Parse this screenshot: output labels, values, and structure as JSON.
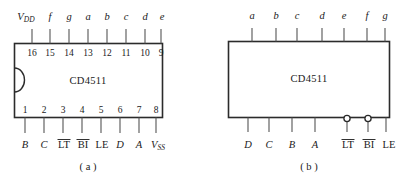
{
  "figure": {
    "ink_color": "#1a1a1a",
    "line_color": "#2b2b2b",
    "lead_color": "#555555",
    "background": "#ffffff"
  },
  "diagram_a": {
    "caption": "( a )",
    "chip_name": "CD4511",
    "package_note": "dual-in-line package outline with left-edge notch",
    "top_pins": [
      {
        "number": "16",
        "label": "V",
        "sub": "DD",
        "italic": true,
        "overbar": false
      },
      {
        "number": "15",
        "label": "f",
        "sub": "",
        "italic": true,
        "overbar": false
      },
      {
        "number": "14",
        "label": "g",
        "sub": "",
        "italic": true,
        "overbar": false
      },
      {
        "number": "13",
        "label": "a",
        "sub": "",
        "italic": true,
        "overbar": false
      },
      {
        "number": "12",
        "label": "b",
        "sub": "",
        "italic": true,
        "overbar": false
      },
      {
        "number": "11",
        "label": "c",
        "sub": "",
        "italic": true,
        "overbar": false
      },
      {
        "number": "10",
        "label": "d",
        "sub": "",
        "italic": true,
        "overbar": false
      },
      {
        "number": "9",
        "label": "e",
        "sub": "",
        "italic": true,
        "overbar": false
      }
    ],
    "bottom_pins": [
      {
        "number": "1",
        "label": "B",
        "sub": "",
        "italic": true,
        "overbar": false
      },
      {
        "number": "2",
        "label": "C",
        "sub": "",
        "italic": true,
        "overbar": false
      },
      {
        "number": "3",
        "label": "LT",
        "sub": "",
        "italic": false,
        "overbar": true
      },
      {
        "number": "4",
        "label": "BI",
        "sub": "",
        "italic": false,
        "overbar": true
      },
      {
        "number": "5",
        "label": "LE",
        "sub": "",
        "italic": false,
        "overbar": false
      },
      {
        "number": "6",
        "label": "D",
        "sub": "",
        "italic": true,
        "overbar": false
      },
      {
        "number": "7",
        "label": "A",
        "sub": "",
        "italic": true,
        "overbar": false
      },
      {
        "number": "8",
        "label": "V",
        "sub": "SS",
        "italic": true,
        "overbar": false
      }
    ]
  },
  "diagram_b": {
    "caption": "( b )",
    "chip_name": "CD4511",
    "top_pins": [
      {
        "label": "a",
        "italic": true,
        "overbar": false,
        "bubble": false
      },
      {
        "label": "b",
        "italic": true,
        "overbar": false,
        "bubble": false
      },
      {
        "label": "c",
        "italic": true,
        "overbar": false,
        "bubble": false
      },
      {
        "label": "d",
        "italic": true,
        "overbar": false,
        "bubble": false
      },
      {
        "label": "e",
        "italic": true,
        "overbar": false,
        "bubble": false
      },
      {
        "label": "f",
        "italic": true,
        "overbar": false,
        "bubble": false
      },
      {
        "label": "g",
        "italic": true,
        "overbar": false,
        "bubble": false
      }
    ],
    "bottom_pins": [
      {
        "label": "D",
        "italic": true,
        "overbar": false,
        "bubble": false
      },
      {
        "label": "C",
        "italic": true,
        "overbar": false,
        "bubble": false
      },
      {
        "label": "B",
        "italic": true,
        "overbar": false,
        "bubble": false
      },
      {
        "label": "A",
        "italic": true,
        "overbar": false,
        "bubble": false
      },
      {
        "label": "LT",
        "italic": false,
        "overbar": true,
        "bubble": true
      },
      {
        "label": "BI",
        "italic": false,
        "overbar": true,
        "bubble": true
      },
      {
        "label": "LE",
        "italic": false,
        "overbar": false,
        "bubble": false
      }
    ]
  }
}
